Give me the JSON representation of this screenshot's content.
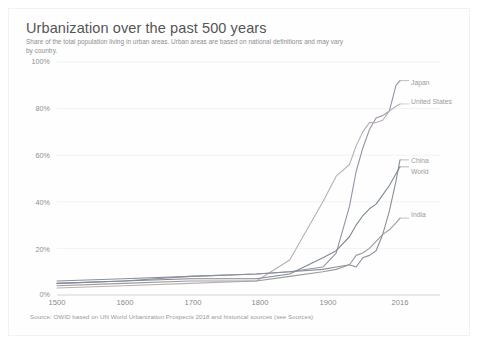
{
  "chart_data": {
    "type": "line",
    "title": "Urbanization over the past 500 years",
    "subtitle": "Share of the total population living in urban areas. Urban areas are based on national definitions and may vary by country.",
    "source": "Source: OWID based on UN World Urbanization Prospects 2018 and historical sources (see Sources)",
    "xlabel": "",
    "ylabel": "",
    "xlim": [
      1500,
      2016
    ],
    "ylim": [
      0,
      100
    ],
    "grid": true,
    "legend_position": "right-inline-labels",
    "y_ticks": [
      "0%",
      "20%",
      "40%",
      "60%",
      "80%",
      "100%"
    ],
    "y_tick_values": [
      0,
      20,
      40,
      60,
      80,
      100
    ],
    "x_ticks": [
      "1500",
      "1600",
      "1700",
      "1800",
      "1900",
      "2016"
    ],
    "x_tick_values": [
      1500,
      1600,
      1700,
      1800,
      1900,
      2016
    ],
    "x": [
      1500,
      1600,
      1700,
      1800,
      1850,
      1900,
      1920,
      1940,
      1950,
      1960,
      1970,
      1980,
      1990,
      2000,
      2010,
      2016
    ],
    "series": [
      {
        "name": "Japan",
        "color": "#9a8fa8",
        "label_y_pct": 92,
        "values": [
          5,
          6,
          8,
          9,
          10,
          12,
          18,
          38,
          53,
          63,
          71,
          76,
          77,
          79,
          90,
          92
        ]
      },
      {
        "name": "United States",
        "color": "#b8b0b0",
        "label_y_pct": 82,
        "values": [
          3,
          4,
          5,
          6,
          15,
          40,
          51,
          56,
          64,
          70,
          74,
          74,
          75,
          79,
          81,
          82
        ]
      },
      {
        "name": "China",
        "color": "#8a8f99",
        "label_y_pct": 58,
        "values": [
          6,
          7,
          8,
          9,
          10,
          11,
          12,
          13,
          12,
          16,
          17,
          19,
          26,
          36,
          49,
          58
        ]
      },
      {
        "name": "World",
        "color": "#7d8a93",
        "label_y_pct": 55,
        "values": [
          5,
          6,
          7,
          7,
          9,
          16,
          19,
          25,
          30,
          34,
          37,
          39,
          43,
          47,
          52,
          55
        ]
      },
      {
        "name": "India",
        "color": "#9b9b9b",
        "label_y_pct": 33,
        "values": [
          4,
          5,
          6,
          6,
          8,
          10,
          11,
          13,
          17,
          18,
          20,
          23,
          26,
          28,
          31,
          33
        ]
      }
    ]
  },
  "labels": {
    "japan": "Japan",
    "united_states": "United States",
    "china": "China",
    "world": "World",
    "india": "India"
  },
  "axis": {
    "y0": "0%",
    "y20": "20%",
    "y40": "40%",
    "y60": "60%",
    "y80": "80%",
    "y100": "100%",
    "x1500": "1500",
    "x1600": "1600",
    "x1700": "1700",
    "x1800": "1800",
    "x1900": "1900",
    "x2016": "2016"
  }
}
